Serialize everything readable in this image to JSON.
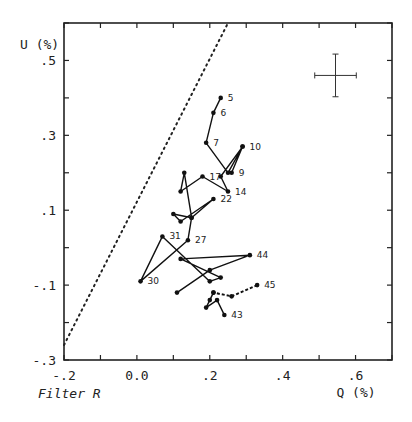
{
  "chart_data": {
    "type": "line",
    "title": "",
    "caption": "Filter R",
    "xlabel": "Q (%)",
    "ylabel": "U (%)",
    "xlim": [
      -0.2,
      0.7
    ],
    "ylim": [
      -0.3,
      0.6
    ],
    "x_tick_labels": [
      "-.2",
      "0.0",
      ".2",
      ".4",
      ".6"
    ],
    "x_tick_values": [
      -0.2,
      0.0,
      0.2,
      0.4,
      0.6
    ],
    "y_tick_labels": [
      ".5",
      ".3",
      ".1",
      "-.1",
      "-.3"
    ],
    "y_tick_values": [
      0.5,
      0.3,
      0.1,
      -0.1,
      -0.3
    ],
    "grid": false,
    "legend": "none",
    "series": [
      {
        "name": "solid path",
        "style": "solid",
        "points": [
          {
            "q": 0.23,
            "u": 0.4,
            "label": "5"
          },
          {
            "q": 0.21,
            "u": 0.36,
            "label": "6"
          },
          {
            "q": 0.19,
            "u": 0.28,
            "label": "7"
          },
          {
            "q": 0.25,
            "u": 0.2,
            "label": ""
          },
          {
            "q": 0.29,
            "u": 0.27,
            "label": "10"
          },
          {
            "q": 0.26,
            "u": 0.2,
            "label": "9"
          },
          {
            "q": 0.29,
            "u": 0.27,
            "label": ""
          },
          {
            "q": 0.23,
            "u": 0.19,
            "label": ""
          },
          {
            "q": 0.25,
            "u": 0.15,
            "label": "14"
          },
          {
            "q": 0.18,
            "u": 0.19,
            "label": "17"
          },
          {
            "q": 0.12,
            "u": 0.15,
            "label": ""
          },
          {
            "q": 0.13,
            "u": 0.2,
            "label": ""
          },
          {
            "q": 0.15,
            "u": 0.08,
            "label": ""
          },
          {
            "q": 0.21,
            "u": 0.13,
            "label": "22"
          },
          {
            "q": 0.12,
            "u": 0.07,
            "label": ""
          },
          {
            "q": 0.1,
            "u": 0.09,
            "label": ""
          },
          {
            "q": 0.15,
            "u": 0.08,
            "label": ""
          },
          {
            "q": 0.14,
            "u": 0.02,
            "label": "27"
          },
          {
            "q": 0.01,
            "u": -0.09,
            "label": "30"
          },
          {
            "q": 0.07,
            "u": 0.03,
            "label": "31"
          },
          {
            "q": 0.2,
            "u": -0.09,
            "label": ""
          },
          {
            "q": 0.23,
            "u": -0.08,
            "label": ""
          },
          {
            "q": 0.12,
            "u": -0.03,
            "label": ""
          },
          {
            "q": 0.31,
            "u": -0.02,
            "label": "44"
          },
          {
            "q": 0.2,
            "u": -0.06,
            "label": ""
          },
          {
            "q": 0.11,
            "u": -0.12,
            "label": ""
          }
        ]
      },
      {
        "name": "dashed path",
        "style": "dashed",
        "points": [
          {
            "q": 0.33,
            "u": -0.1,
            "label": "45"
          },
          {
            "q": 0.26,
            "u": -0.13,
            "label": ""
          },
          {
            "q": 0.21,
            "u": -0.12,
            "label": ""
          }
        ]
      },
      {
        "name": "end cluster",
        "style": "solid",
        "points": [
          {
            "q": 0.21,
            "u": -0.12,
            "label": ""
          },
          {
            "q": 0.2,
            "u": -0.14,
            "label": ""
          },
          {
            "q": 0.19,
            "u": -0.16,
            "label": ""
          },
          {
            "q": 0.22,
            "u": -0.14,
            "label": ""
          },
          {
            "q": 0.24,
            "u": -0.18,
            "label": "43"
          }
        ]
      }
    ],
    "reference_line": {
      "style": "dotted",
      "from": {
        "q": -0.2,
        "u": -0.26
      },
      "to": {
        "q": 0.25,
        "u": 0.6
      }
    },
    "error_cross": {
      "q": 0.545,
      "u": 0.46,
      "dq": 0.057,
      "du": 0.057
    }
  }
}
